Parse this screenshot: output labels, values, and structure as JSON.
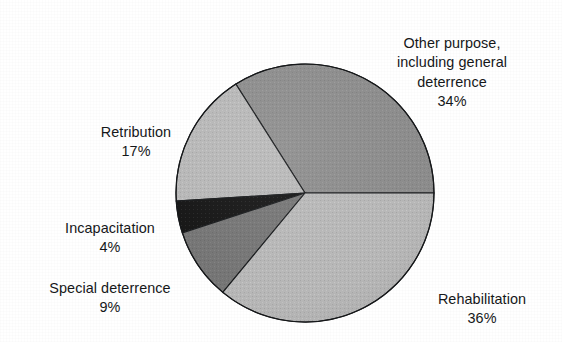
{
  "chart_data": {
    "type": "pie",
    "title": "",
    "subtitle": "",
    "xlabel": "",
    "ylabel": "",
    "legend_position": "none",
    "grid": false,
    "units": "percent",
    "total": 100,
    "categories": [
      "Other purpose, including general deterrence",
      "Rehabilitation",
      "Retribution",
      "Special deterrence",
      "Incapacitation"
    ],
    "values": [
      34,
      36,
      17,
      9,
      4
    ],
    "slices": [
      {
        "name": "other-purpose",
        "label": "Other purpose,\nincluding general\ndeterrence",
        "value": 34,
        "value_text": "34%",
        "color": "#8a8a8a",
        "start_angle_deg": 0,
        "end_angle_deg": 122.4
      },
      {
        "name": "retribution",
        "label": "Retribution",
        "value": 17,
        "value_text": "17%",
        "color": "#b5b5b5",
        "start_angle_deg": 122.4,
        "end_angle_deg": 183.6
      },
      {
        "name": "incapacitation",
        "label": "Incapacitation",
        "value": 4,
        "value_text": "4%",
        "color": "#111111",
        "start_angle_deg": 183.6,
        "end_angle_deg": 198.0
      },
      {
        "name": "special-deterrence",
        "label": "Special deterrence",
        "value": 9,
        "value_text": "9%",
        "color": "#737373",
        "start_angle_deg": 198.0,
        "end_angle_deg": 230.4
      },
      {
        "name": "rehabilitation",
        "label": "Rehabilitation",
        "value": 36,
        "value_text": "36%",
        "color": "#b3b3b3",
        "start_angle_deg": 230.4,
        "end_angle_deg": 360
      }
    ]
  },
  "labels": {
    "other_purpose": {
      "text": "Other purpose,\nincluding general\ndeterrence",
      "value": "34%"
    },
    "retribution": {
      "text": "Retribution",
      "value": "17%"
    },
    "incapacitation": {
      "text": "Incapacitation",
      "value": "4%"
    },
    "special_deterrence": {
      "text": "Special deterrence",
      "value": "9%"
    },
    "rehabilitation": {
      "text": "Rehabilitation",
      "value": "36%"
    }
  },
  "style": {
    "background": "#ffffff",
    "outline": "#16181a",
    "text_color": "#16181a"
  }
}
